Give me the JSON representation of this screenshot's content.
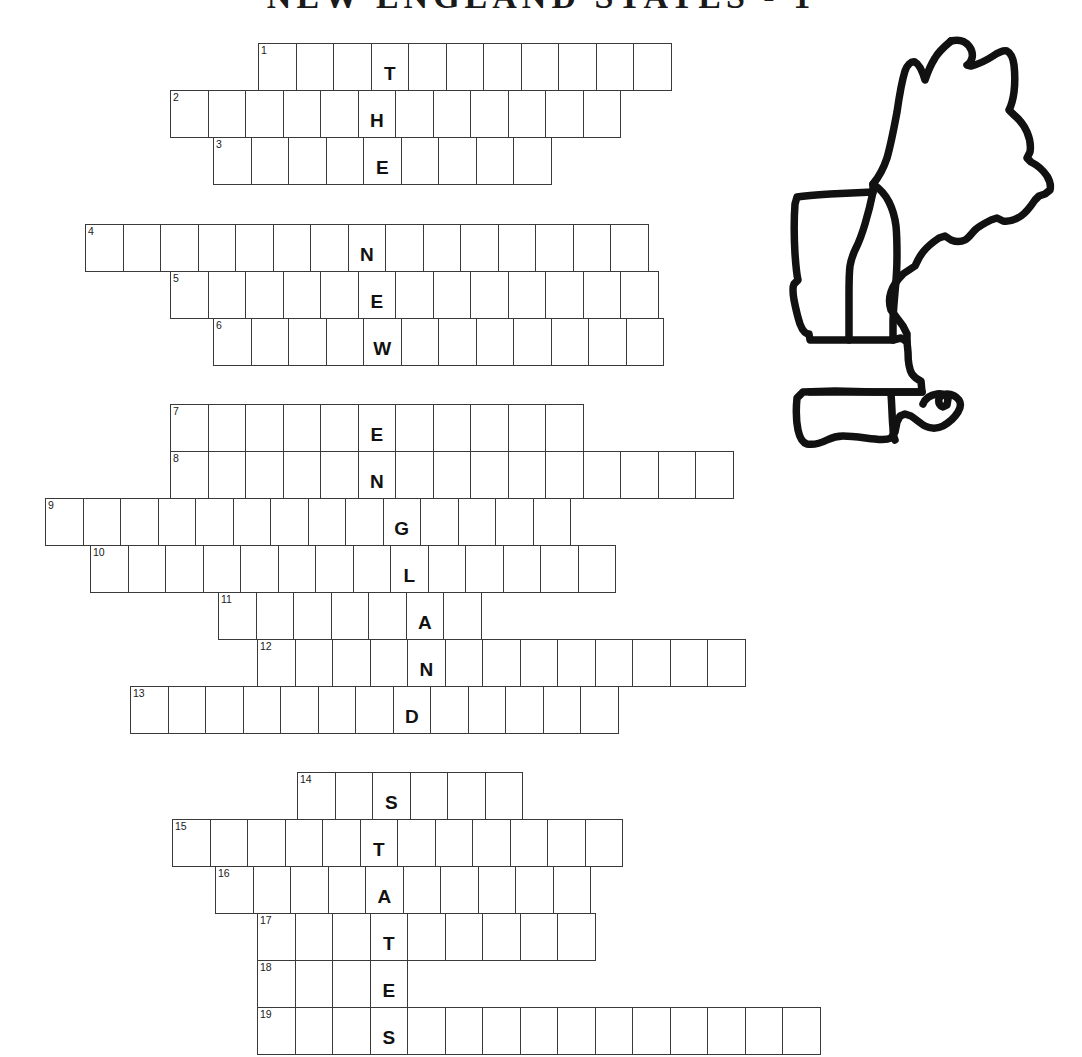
{
  "title": "NEW ENGLAND STATES - 1",
  "theme_word": "THE NEW ENGLAND STATES",
  "map": {
    "name": "new-england-outline",
    "region_label": "New England",
    "stroke_color": "#111111",
    "fill_color": "#ffffff",
    "states_outlined": [
      "Maine",
      "New Hampshire",
      "Vermont",
      "Massachusetts",
      "Rhode Island",
      "Connecticut"
    ]
  },
  "grid": {
    "cell_width": 38.5,
    "cell_height": 48,
    "border_color": "#3a3a3a",
    "letter_color": "#111111",
    "number_color": "#1a1a1a"
  },
  "rows": [
    {
      "number": "1",
      "left": 258,
      "top": 44,
      "cells": 11,
      "letter": "T",
      "letter_index": 3
    },
    {
      "number": "2",
      "left": 170,
      "top": 91,
      "cells": 12,
      "letter": "H",
      "letter_index": 5
    },
    {
      "number": "3",
      "left": 213,
      "top": 138,
      "cells": 9,
      "letter": "E",
      "letter_index": 4
    },
    {
      "number": "4",
      "left": 85,
      "top": 225,
      "cells": 15,
      "letter": "N",
      "letter_index": 7
    },
    {
      "number": "5",
      "top": 272,
      "left": 170,
      "cells": 13,
      "letter": "E",
      "letter_index": 5
    },
    {
      "number": "6",
      "left": 213,
      "top": 319,
      "cells": 12,
      "letter": "W",
      "letter_index": 4
    },
    {
      "number": "7",
      "left": 170,
      "top": 405,
      "cells": 11,
      "letter": "E",
      "letter_index": 5
    },
    {
      "number": "8",
      "left": 170,
      "top": 452,
      "cells": 15,
      "letter": "N",
      "letter_index": 5
    },
    {
      "number": "9",
      "left": 45,
      "top": 499,
      "cells": 14,
      "letter": "G",
      "letter_index": 9
    },
    {
      "number": "10",
      "left": 90,
      "top": 546,
      "cells": 14,
      "letter": "L",
      "letter_index": 8
    },
    {
      "number": "11",
      "left": 218,
      "top": 593,
      "cells": 7,
      "letter": "A",
      "letter_index": 5
    },
    {
      "number": "12",
      "left": 257,
      "top": 640,
      "cells": 13,
      "letter": "N",
      "letter_index": 4
    },
    {
      "number": "13",
      "left": 130,
      "top": 687,
      "cells": 13,
      "letter": "D",
      "letter_index": 7
    },
    {
      "number": "14",
      "left": 297,
      "top": 773,
      "cells": 6,
      "letter": "S",
      "letter_index": 2
    },
    {
      "number": "15",
      "left": 172,
      "top": 820,
      "cells": 12,
      "letter": "T",
      "letter_index": 5
    },
    {
      "number": "16",
      "left": 215,
      "top": 867,
      "cells": 10,
      "letter": "A",
      "letter_index": 4
    },
    {
      "number": "17",
      "left": 257,
      "top": 914,
      "cells": 9,
      "letter": "T",
      "letter_index": 3
    },
    {
      "number": "18",
      "left": 257,
      "top": 961,
      "cells": 4,
      "letter": "E",
      "letter_index": 3
    },
    {
      "number": "19",
      "left": 257,
      "top": 1008,
      "cells": 15,
      "letter": "S",
      "letter_index": 3
    }
  ]
}
